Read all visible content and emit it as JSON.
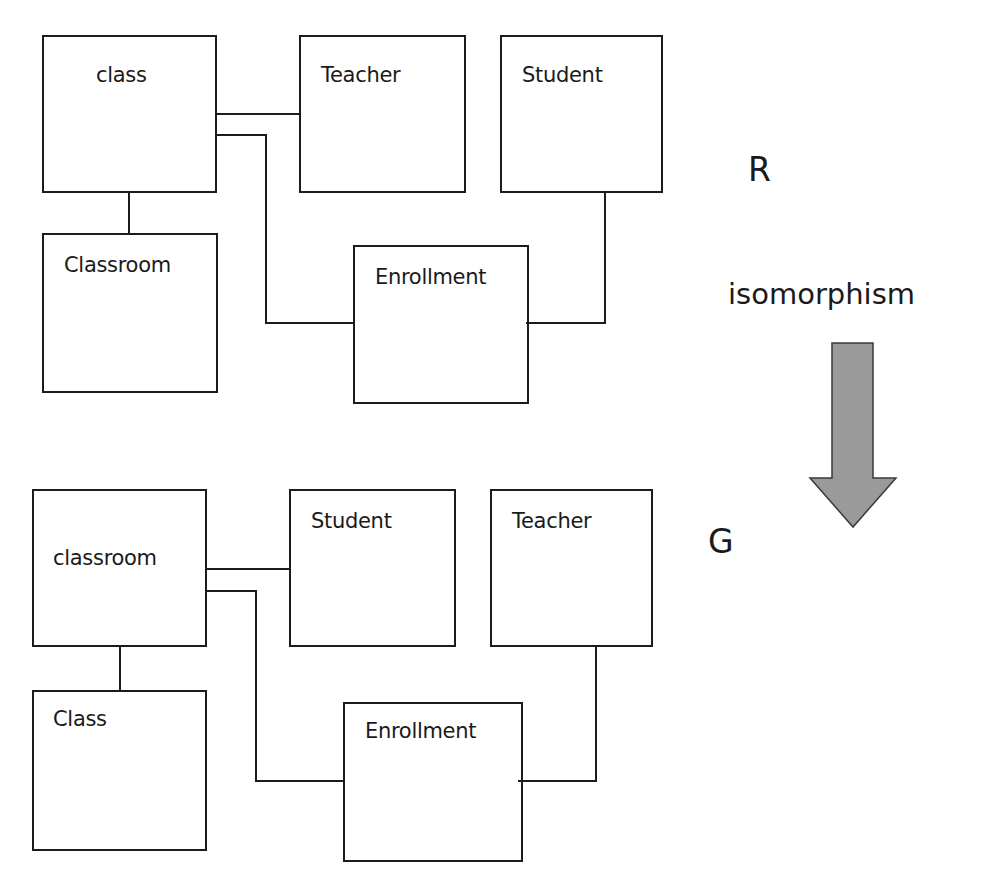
{
  "diagram_R": {
    "label": "R",
    "entities": [
      {
        "id": "class",
        "label": "class"
      },
      {
        "id": "teacher",
        "label": "Teacher"
      },
      {
        "id": "student",
        "label": "Student"
      },
      {
        "id": "classroom",
        "label": "Classroom"
      },
      {
        "id": "enrollment",
        "label": "Enrollment"
      }
    ],
    "relationships": [
      [
        "class",
        "Teacher"
      ],
      [
        "class",
        "Enrollment"
      ],
      [
        "class",
        "Classroom"
      ],
      [
        "Student",
        "Enrollment"
      ]
    ]
  },
  "transformation": {
    "label": "isomorphism",
    "arrow_direction": "down",
    "arrow_color": "#999999"
  },
  "diagram_G": {
    "label": "G",
    "entities": [
      {
        "id": "classroom",
        "label": "classroom"
      },
      {
        "id": "student",
        "label": "Student"
      },
      {
        "id": "teacher",
        "label": "Teacher"
      },
      {
        "id": "class",
        "label": "Class"
      },
      {
        "id": "enrollment",
        "label": "Enrollment"
      }
    ],
    "relationships": [
      [
        "classroom",
        "Student"
      ],
      [
        "classroom",
        "Enrollment"
      ],
      [
        "classroom",
        "Class"
      ],
      [
        "Teacher",
        "Enrollment"
      ]
    ]
  }
}
